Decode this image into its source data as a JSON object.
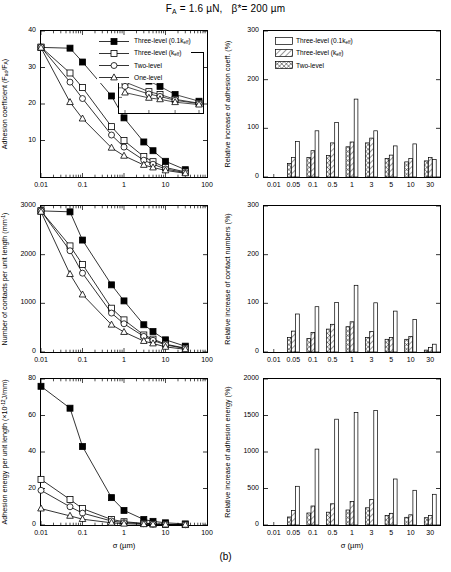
{
  "title_parts": {
    "fa": "F",
    "fa_sub": "A",
    "eq1": " = 1.6 µN,   ",
    "beta": "β*= 200 µm"
  },
  "caption": "(b)",
  "axis_x_label": "σ (µm)",
  "legend_line": [
    {
      "label": "Three-level (0.1k",
      "sub": "eff",
      "tail": ")",
      "marker": "filled-square"
    },
    {
      "label": "Three-level (k",
      "sub": "eff",
      "tail": ")",
      "marker": "open-square"
    },
    {
      "label": "Two-level",
      "sub": "",
      "tail": "",
      "marker": "open-circle"
    },
    {
      "label": "One-level",
      "sub": "",
      "tail": "",
      "marker": "open-triangle"
    }
  ],
  "legend_bar": [
    {
      "label": "Three-level (0.1k",
      "sub": "eff",
      "tail": ")",
      "fill": "plain"
    },
    {
      "label": "Three-level (k",
      "sub": "eff",
      "tail": ")",
      "fill": "hatch-diagonal"
    },
    {
      "label": "Two-level",
      "sub": "",
      "tail": "",
      "fill": "hatch-cross"
    }
  ],
  "chart_data": [
    {
      "id": "adhesion-coefficient",
      "type": "line",
      "position": "top-left",
      "title": "",
      "xlabel": "σ (µm)",
      "ylabel": "Adhesion coefficient (F",
      "ylabel_sub": "ad",
      "ylabel_mid": "/F",
      "ylabel_sub2": "A",
      "ylabel_tail": ")",
      "xscale": "log",
      "xlim": [
        0.01,
        100
      ],
      "ylim": [
        0,
        40
      ],
      "xticks": [
        0.01,
        0.1,
        1,
        10,
        100
      ],
      "xticklabels": [
        "0.01",
        "0.1",
        "1",
        "10",
        "100"
      ],
      "yticks": [
        10,
        20,
        30,
        40
      ],
      "yticklabels": [
        "10",
        "20",
        "30",
        "40"
      ],
      "grid": false,
      "series": [
        {
          "name": "Three-level (0.1k_eff)",
          "marker": "filled-square",
          "x": [
            0.01,
            0.05,
            0.1,
            0.5,
            1,
            3,
            5,
            10,
            30
          ],
          "y": [
            35.5,
            35.3,
            31.5,
            22.2,
            16.2,
            9.6,
            7.2,
            4.3,
            2.0
          ]
        },
        {
          "name": "Three-level (k_eff)",
          "marker": "open-square",
          "x": [
            0.01,
            0.05,
            0.1,
            0.5,
            1,
            3,
            5,
            10,
            30
          ],
          "y": [
            35.6,
            28.5,
            24.5,
            13.8,
            10.0,
            5.6,
            4.2,
            2.6,
            1.4
          ]
        },
        {
          "name": "Two-level",
          "marker": "open-circle",
          "x": [
            0.01,
            0.05,
            0.1,
            0.5,
            1,
            3,
            5,
            10,
            30
          ],
          "y": [
            35.6,
            26.0,
            21.5,
            11.5,
            8.2,
            4.6,
            3.5,
            2.2,
            1.2
          ]
        },
        {
          "name": "One-level",
          "marker": "open-triangle",
          "x": [
            0.01,
            0.05,
            0.1,
            0.5,
            1,
            3,
            5,
            10,
            30
          ],
          "y": [
            35.4,
            20.5,
            16.0,
            8.0,
            5.8,
            3.3,
            2.6,
            1.8,
            1.0
          ]
        }
      ],
      "inset": {
        "xlim": [
          1,
          30
        ],
        "ylim": [
          0,
          10
        ],
        "series": [
          {
            "name": "Three-level (0.1k_eff)",
            "marker": "filled-square",
            "x": [
              1,
              3,
              5,
              10,
              30
            ],
            "y": [
              8.0,
              5.4,
              4.3,
              2.6,
              1.2
            ]
          },
          {
            "name": "Three-level (k_eff)",
            "marker": "open-square",
            "x": [
              1,
              3,
              5,
              10,
              30
            ],
            "y": [
              5.2,
              3.2,
              2.6,
              1.6,
              0.8
            ]
          },
          {
            "name": "Two-level",
            "marker": "open-circle",
            "x": [
              1,
              3,
              5,
              10,
              30
            ],
            "y": [
              4.3,
              2.7,
              2.2,
              1.4,
              0.7
            ]
          },
          {
            "name": "One-level",
            "marker": "open-triangle",
            "x": [
              1,
              3,
              5,
              10,
              30
            ],
            "y": [
              3.0,
              1.9,
              1.6,
              1.0,
              0.5
            ]
          }
        ]
      }
    },
    {
      "id": "relative-increase-adhesion-coeff",
      "type": "bar",
      "position": "top-right",
      "xlabel": "σ (µm)",
      "ylabel": "Relative increase of adhesion coeff. (%)",
      "categories": [
        "0.01",
        "0.05",
        "0.1",
        "0.5",
        "1",
        "3",
        "5",
        "10",
        "30"
      ],
      "ylim": [
        0,
        300
      ],
      "yticks": [
        0,
        100,
        200,
        300
      ],
      "yticklabels": [
        "0",
        "100",
        "200",
        "300"
      ],
      "grid": false,
      "series": [
        {
          "name": "Two-level",
          "fill": "hatch-cross",
          "values": [
            0,
            28,
            40,
            44,
            62,
            70,
            38,
            31,
            33
          ]
        },
        {
          "name": "Three-level (k_eff)",
          "fill": "hatch-diagonal",
          "values": [
            0,
            40,
            54,
            70,
            72,
            80,
            45,
            38,
            40
          ]
        },
        {
          "name": "Three-level (0.1k_eff)",
          "fill": "plain",
          "values": [
            0,
            73,
            95,
            112,
            160,
            95,
            64,
            68,
            36
          ]
        }
      ]
    },
    {
      "id": "number-of-contacts",
      "type": "line",
      "position": "middle-left",
      "xlabel": "σ (µm)",
      "ylabel": "Number of contacts per unit length (mm",
      "ylabel_sup": "-1",
      "ylabel_tail": ")",
      "xscale": "log",
      "xlim": [
        0.01,
        100
      ],
      "ylim": [
        0,
        3000
      ],
      "xticks": [
        0.01,
        0.1,
        1,
        10,
        100
      ],
      "xticklabels": [
        "0.01",
        "0.1",
        "1",
        "10",
        "100"
      ],
      "yticks": [
        0,
        1000,
        2000,
        3000
      ],
      "yticklabels": [
        "0",
        "1000",
        "2000",
        "3000"
      ],
      "grid": false,
      "series": [
        {
          "name": "Three-level (0.1k_eff)",
          "marker": "filled-square",
          "x": [
            0.01,
            0.05,
            0.1,
            0.5,
            1,
            3,
            5,
            10,
            30
          ],
          "y": [
            2900,
            2880,
            2300,
            1380,
            1050,
            560,
            420,
            250,
            120
          ]
        },
        {
          "name": "Three-level (k_eff)",
          "marker": "open-square",
          "x": [
            0.01,
            0.05,
            0.1,
            0.5,
            1,
            3,
            5,
            10,
            30
          ],
          "y": [
            2900,
            2180,
            1800,
            900,
            660,
            350,
            265,
            160,
            80
          ]
        },
        {
          "name": "Two-level",
          "marker": "open-circle",
          "x": [
            0.01,
            0.05,
            0.1,
            0.5,
            1,
            3,
            5,
            10,
            30
          ],
          "y": [
            2900,
            2080,
            1620,
            800,
            580,
            320,
            240,
            145,
            72
          ]
        },
        {
          "name": "One-level",
          "marker": "open-triangle",
          "x": [
            0.01,
            0.05,
            0.1,
            0.5,
            1,
            3,
            5,
            10,
            30
          ],
          "y": [
            2880,
            1600,
            1180,
            560,
            410,
            225,
            175,
            105,
            55
          ]
        }
      ]
    },
    {
      "id": "relative-increase-contact-numbers",
      "type": "bar",
      "position": "middle-right",
      "xlabel": "σ (µm)",
      "ylabel": "Relative increase of contact numbers (%)",
      "categories": [
        "0.01",
        "0.05",
        "0.1",
        "0.5",
        "1",
        "3",
        "5",
        "10",
        "30"
      ],
      "ylim": [
        0,
        300
      ],
      "yticks": [
        0,
        100,
        200,
        300
      ],
      "yticklabels": [
        "0",
        "100",
        "200",
        "300"
      ],
      "grid": false,
      "series": [
        {
          "name": "Two-level",
          "fill": "hatch-cross",
          "values": [
            0,
            30,
            28,
            47,
            52,
            30,
            26,
            26,
            4
          ]
        },
        {
          "name": "Three-level (k_eff)",
          "fill": "hatch-diagonal",
          "values": [
            0,
            43,
            40,
            57,
            62,
            42,
            30,
            32,
            9
          ]
        },
        {
          "name": "Three-level (0.1k_eff)",
          "fill": "plain",
          "values": [
            0,
            78,
            93,
            102,
            137,
            101,
            84,
            67,
            16
          ]
        }
      ]
    },
    {
      "id": "adhesion-energy",
      "type": "line",
      "position": "bottom-left",
      "xlabel": "σ (µm)",
      "ylabel": "Adhesion energy per unit length (×10",
      "ylabel_sup": "-12",
      "ylabel_tail": "J/mm)",
      "xscale": "log",
      "xlim": [
        0.01,
        100
      ],
      "ylim": [
        0,
        80
      ],
      "xticks": [
        0.01,
        0.1,
        1,
        10,
        100
      ],
      "xticklabels": [
        "0.01",
        "0.1",
        "1",
        "10",
        "100"
      ],
      "yticks": [
        0,
        20,
        40,
        60,
        80
      ],
      "yticklabels": [
        "0",
        "20",
        "40",
        "60",
        "80"
      ],
      "grid": false,
      "series": [
        {
          "name": "Three-level (0.1k_eff)",
          "marker": "filled-square",
          "x": [
            0.01,
            0.05,
            0.1,
            0.5,
            1,
            3,
            5,
            10,
            30
          ],
          "y": [
            76,
            64,
            43,
            15,
            8,
            3,
            2,
            1.2,
            0.6
          ]
        },
        {
          "name": "Three-level (k_eff)",
          "marker": "open-square",
          "x": [
            0.01,
            0.05,
            0.1,
            0.5,
            1,
            3,
            5,
            10,
            30
          ],
          "y": [
            25,
            14,
            9,
            3,
            1.8,
            0.9,
            0.6,
            0.4,
            0.2
          ]
        },
        {
          "name": "Two-level",
          "marker": "open-circle",
          "x": [
            0.01,
            0.05,
            0.1,
            0.5,
            1,
            3,
            5,
            10,
            30
          ],
          "y": [
            19,
            10,
            6.5,
            2.2,
            1.3,
            0.7,
            0.5,
            0.3,
            0.15
          ]
        },
        {
          "name": "One-level",
          "marker": "open-triangle",
          "x": [
            0.01,
            0.05,
            0.1,
            0.5,
            1,
            3,
            5,
            10,
            30
          ],
          "y": [
            9,
            5,
            3.2,
            1.2,
            0.7,
            0.4,
            0.3,
            0.2,
            0.1
          ]
        }
      ]
    },
    {
      "id": "relative-increase-adhesion-energy",
      "type": "bar",
      "position": "bottom-right",
      "xlabel": "σ (µm)",
      "ylabel": "Relative increase of adhesion energy (%)",
      "categories": [
        "0.01",
        "0.05",
        "0.1",
        "0.5",
        "1",
        "3",
        "5",
        "10",
        "30"
      ],
      "ylim": [
        0,
        2000
      ],
      "yticks": [
        0,
        500,
        1000,
        1500,
        2000
      ],
      "yticklabels": [
        "0",
        "500",
        "1000",
        "1500",
        "2000"
      ],
      "grid": false,
      "series": [
        {
          "name": "Two-level",
          "fill": "hatch-cross",
          "values": [
            0,
            110,
            165,
            175,
            205,
            235,
            130,
            105,
            100
          ]
        },
        {
          "name": "Three-level (k_eff)",
          "fill": "hatch-diagonal",
          "values": [
            0,
            200,
            260,
            290,
            320,
            350,
            160,
            140,
            130
          ]
        },
        {
          "name": "Three-level (0.1k_eff)",
          "fill": "plain",
          "values": [
            0,
            530,
            1040,
            1450,
            1540,
            1570,
            630,
            475,
            420
          ]
        }
      ]
    }
  ]
}
